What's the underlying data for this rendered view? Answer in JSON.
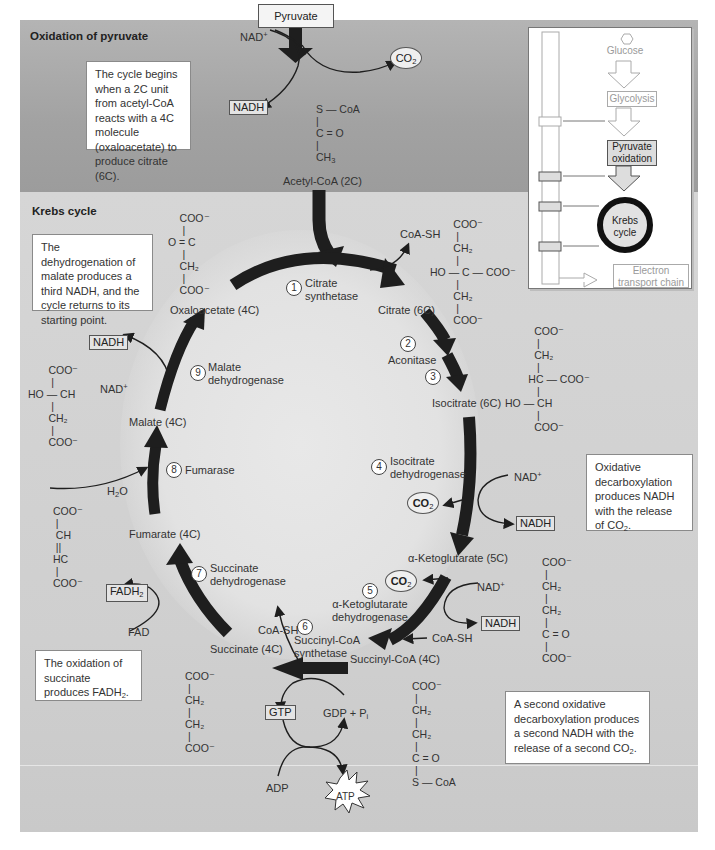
{
  "sections": {
    "top_title": "Oxidation of pyruvate",
    "main_title": "Krebs cycle"
  },
  "notes": {
    "cycle_begins": "The cycle begins when a 2C unit from acetyl-CoA reacts with a 4C molecule (oxaloacetate) to produce citrate (6C).",
    "malate": "The dehydrogenation of malate produces a third NADH, and the cycle returns to its starting point.",
    "oxidative": "Oxidative decarboxylation produces NADH with the release of CO",
    "oxidative_sub": "2",
    "oxidative_end": ".",
    "succinate": "The oxidation of succinate produces FADH",
    "succinate_sub": "2",
    "succinate_end": ".",
    "second": "A second oxidative decarboxylation produces a second NADH with the release of a second CO",
    "second_sub": "2",
    "second_end": "."
  },
  "pyruvate_step": {
    "pyruvate": "Pyruvate",
    "nad": "NAD",
    "nad_sup": "+",
    "nadh": "NADH",
    "co2": "CO",
    "co2_sub": "2",
    "acetyl_structure": [
      "S — CoA",
      "|",
      "C = O",
      "|",
      "CH"
    ],
    "acetyl_sub": "3",
    "acetyl_label": "Acetyl-CoA (2C)"
  },
  "metabolites": {
    "oxaloacetate": "Oxaloacetate (4C)",
    "citrate": "Citrate (6C)",
    "isocitrate": "Isocitrate (6C)",
    "ketoglutarate": "α-Ketoglutarate (5C)",
    "succinyl_coa": "Succinyl-CoA (4C)",
    "succinate": "Succinate (4C)",
    "fumarate": "Fumarate (4C)",
    "malate": "Malate (4C)"
  },
  "enzymes": [
    {
      "num": "1",
      "name": "Citrate\nsynthetase"
    },
    {
      "num": "2",
      "name": "Aconitase"
    },
    {
      "num": "3",
      "name": ""
    },
    {
      "num": "4",
      "name": "Isocitrate\ndehydrogenase"
    },
    {
      "num": "5",
      "name": "α-Ketoglutarate\ndehydrogenase"
    },
    {
      "num": "6",
      "name": "Succinyl-CoA\nsynthetase"
    },
    {
      "num": "7",
      "name": "Succinate\ndehydrogenase"
    },
    {
      "num": "8",
      "name": "Fumarase"
    },
    {
      "num": "9",
      "name": "Malate\ndehydrogenase"
    }
  ],
  "cofactors": {
    "coash_1": "CoA-SH",
    "coash_2": "CoA-SH",
    "coash_3": "CoA-SH",
    "nad_4": "NAD",
    "nadh_4": "NADH",
    "co2_4": "CO",
    "nad_5": "NAD",
    "nadh_5": "NADH",
    "co2_5": "CO",
    "gtp": "GTP",
    "gdp": "GDP + P",
    "gdp_sub": "i",
    "adp": "ADP",
    "atp": "ATP",
    "fad": "FAD",
    "fadh2": "FADH",
    "h2o": "H",
    "nad_9": "NAD",
    "nadh_9": "NADH",
    "plus": "+",
    "two": "2"
  },
  "structures": {
    "oxaloacetate": "     COO⁻\n      |\n O = C\n      |\n     CH₂\n      |\n     COO⁻",
    "citrate": "        COO⁻\n         |\n        CH₂\n         |\nHO — C — COO⁻\n         |\n        CH₂\n         |\n        COO⁻",
    "isocitrate": "          COO⁻\n           |\n          CH₂\n           |\n        HC — COO⁻\n           |\nHO — CH\n           |\n          COO⁻",
    "ketoglutarate": "COO⁻\n |\nCH₂\n |\nCH₂\n |\nC = O\n |\nCOO⁻",
    "succinyl_coa": "COO⁻\n |\nCH₂\n |\nCH₂\n |\nC = O\n |\nS — CoA",
    "succinate": "COO⁻\n |\nCH₂\n |\nCH₂\n |\nCOO⁻",
    "fumarate": " COO⁻\n  |\n  CH\n  ||\n HC\n  |\n COO⁻",
    "malate": "       COO⁻\n        |\nHO — CH\n        |\n       CH₂\n        |\n       COO⁻"
  },
  "overview": {
    "glucose": "Glucose",
    "glycolysis": "Glycolysis",
    "pyruvate_oxidation": "Pyruvate oxidation",
    "krebs": "Krebs cycle",
    "etc": "Electron transport chain"
  },
  "colors": {
    "arrow": "#1e1e1e",
    "band_top": "#a4a4a4",
    "band_main": "#d2d2d2",
    "note_bg": "#ffffff"
  }
}
